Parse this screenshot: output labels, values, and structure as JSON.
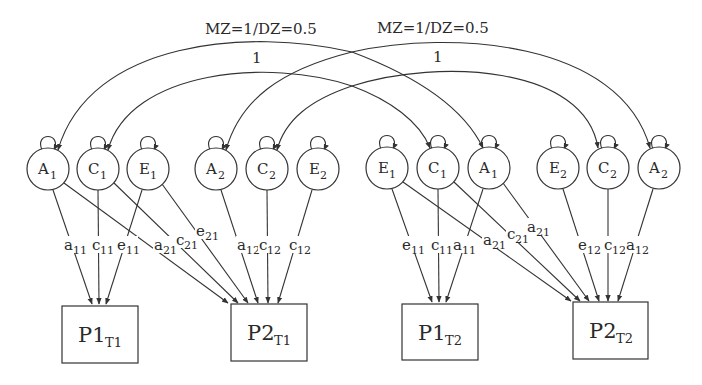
{
  "diagram": {
    "type": "twin ACE cross-lagged path diagram",
    "arcs": [
      {
        "id": "arc-A1",
        "from": "A1 (T1)",
        "to": "A1 (T2)",
        "label": "MZ=1/DZ=0.5"
      },
      {
        "id": "arc-C1",
        "from": "C1 (T1)",
        "to": "C1 (T2)",
        "label": "1"
      },
      {
        "id": "arc-A2",
        "from": "A2 (T1)",
        "to": "A2 (T2)",
        "label": "MZ=1/DZ=0.5"
      },
      {
        "id": "arc-C2",
        "from": "C2 (T1)",
        "to": "C2 (T2)",
        "label": "1"
      }
    ],
    "latents": [
      {
        "id": "A1_t1",
        "letter": "A",
        "sub": "1",
        "cx": 48,
        "cy": 169
      },
      {
        "id": "C1_t1",
        "letter": "C",
        "sub": "1",
        "cx": 98,
        "cy": 169
      },
      {
        "id": "E1_t1",
        "letter": "E",
        "sub": "1",
        "cx": 148,
        "cy": 169
      },
      {
        "id": "A2_t1",
        "letter": "A",
        "sub": "2",
        "cx": 216,
        "cy": 169
      },
      {
        "id": "C2_t1",
        "letter": "C",
        "sub": "2",
        "cx": 267,
        "cy": 169
      },
      {
        "id": "E2_t1",
        "letter": "E",
        "sub": "2",
        "cx": 318,
        "cy": 169
      },
      {
        "id": "E1_t2",
        "letter": "E",
        "sub": "1",
        "cx": 387,
        "cy": 168
      },
      {
        "id": "C1_t2",
        "letter": "C",
        "sub": "1",
        "cx": 438,
        "cy": 168
      },
      {
        "id": "A1_t2",
        "letter": "A",
        "sub": "1",
        "cx": 489,
        "cy": 168
      },
      {
        "id": "E2_t2",
        "letter": "E",
        "sub": "2",
        "cx": 558,
        "cy": 168
      },
      {
        "id": "C2_t2",
        "letter": "C",
        "sub": "2",
        "cx": 608,
        "cy": 168
      },
      {
        "id": "A2_t2",
        "letter": "A",
        "sub": "2",
        "cx": 659,
        "cy": 168
      }
    ],
    "observed": [
      {
        "id": "P1_T1",
        "main": "P1",
        "sub": "T1"
      },
      {
        "id": "P2_T1",
        "main": "P2",
        "sub": "T1"
      },
      {
        "id": "P1_T2",
        "main": "P1",
        "sub": "T2"
      },
      {
        "id": "P2_T2",
        "main": "P2",
        "sub": "T2"
      }
    ],
    "path_labels": [
      {
        "main": "a",
        "sub": "11"
      },
      {
        "main": "c",
        "sub": "11"
      },
      {
        "main": "e",
        "sub": "11"
      },
      {
        "main": "a",
        "sub": "21"
      },
      {
        "main": "c",
        "sub": "21"
      },
      {
        "main": "e",
        "sub": "21"
      },
      {
        "main": "a",
        "sub": "12"
      },
      {
        "main": "c",
        "sub": "12"
      },
      {
        "main": "c",
        "sub": "12"
      },
      {
        "main": "e",
        "sub": "11"
      },
      {
        "main": "c",
        "sub": "11"
      },
      {
        "main": "a",
        "sub": "11"
      },
      {
        "main": "a",
        "sub": "21"
      },
      {
        "main": "c",
        "sub": "21"
      },
      {
        "main": "a",
        "sub": "21"
      },
      {
        "main": "e",
        "sub": "12"
      },
      {
        "main": "c",
        "sub": "12"
      },
      {
        "main": "a",
        "sub": "12"
      }
    ],
    "colors": {
      "stroke": "#333333",
      "text": "#2a2a2a",
      "background": "#ffffff"
    }
  }
}
